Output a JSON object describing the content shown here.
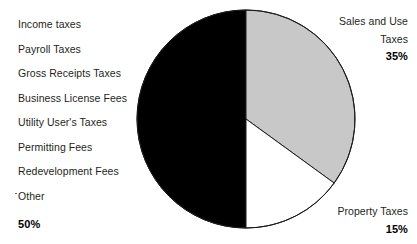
{
  "chart_data": {
    "type": "pie",
    "title": "",
    "subtitle": "",
    "xlabel": "",
    "ylabel": "",
    "legend_position": "callout-labels",
    "grid": false,
    "start_angle_deg": 0,
    "direction": "clockwise",
    "categories": [
      "Sales and Use Taxes",
      "Property Taxes",
      "Other Local Taxes and Fees"
    ],
    "values": [
      35,
      15,
      50
    ],
    "units": "percent",
    "slices": [
      {
        "name": "Sales and Use Taxes",
        "value": 35,
        "percent_label": "35%",
        "color": "#c8c8c8",
        "start_deg": 0,
        "end_deg": 126
      },
      {
        "name": "Property Taxes",
        "value": 15,
        "percent_label": "15%",
        "color": "#ffffff",
        "start_deg": 126,
        "end_deg": 180
      },
      {
        "name": "Other Local Taxes and Fees",
        "value": 50,
        "percent_label": "50%",
        "color": "#000000",
        "start_deg": 180,
        "end_deg": 360,
        "detail_items": [
          "Income taxes",
          "Payroll Taxes",
          "Gross Receipts Taxes",
          "Business License Fees",
          "Utility User's Taxes",
          "Permitting Fees",
          "Redevelopment Fees",
          "Other"
        ]
      }
    ]
  },
  "pie": {
    "center_x": 246,
    "center_y": 119,
    "radius": 109,
    "stroke_color": "#1a1a1a",
    "stroke_width": 1
  },
  "left_callout": {
    "items": [
      {
        "label": "Income taxes"
      },
      {
        "label": "Payroll Taxes"
      },
      {
        "label": "Gross Receipts Taxes"
      },
      {
        "label": "Business License Fees"
      },
      {
        "label": "Utility User's Taxes"
      },
      {
        "label": "Permitting Fees"
      },
      {
        "label": "Redevelopment Fees"
      },
      {
        "label": "Other"
      }
    ],
    "percent": "50%"
  },
  "right_callouts": {
    "sales": {
      "line1": "Sales and Use",
      "line2": "Taxes",
      "percent": "35%"
    },
    "property": {
      "line1": "Property Taxes",
      "percent": "15%"
    }
  },
  "colors": {
    "slice_gray": "#c8c8c8",
    "slice_white": "#ffffff",
    "slice_black": "#000000",
    "text": "#231f20",
    "background": "#ffffff"
  }
}
